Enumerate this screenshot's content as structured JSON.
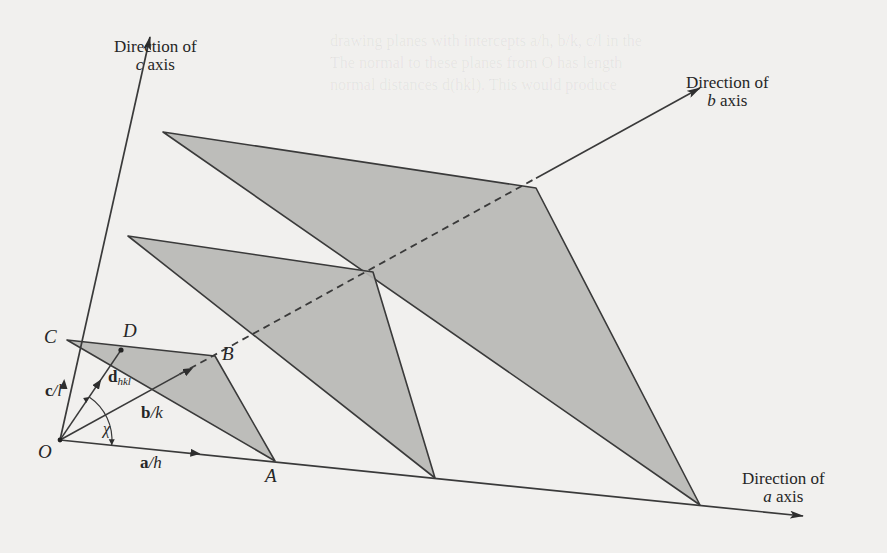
{
  "figure": {
    "colors": {
      "paper": "#f1f0ee",
      "line": "#3a3a3a",
      "plane_fill": "#b9b8b5"
    },
    "axes": {
      "c": {
        "line1": "Direction of",
        "letter": "c",
        "suffix": " axis"
      },
      "b": {
        "line1": "Direction of",
        "letter": "b",
        "suffix": " axis"
      },
      "a": {
        "line1": "Direction of",
        "letter": "a",
        "suffix": " axis"
      }
    },
    "points": {
      "origin": "O",
      "A": "A",
      "B": "B",
      "C": "C",
      "D": "D"
    },
    "vectors": {
      "c_over_l": {
        "bold": "c",
        "rest": "/l"
      },
      "b_over_k": {
        "bold": "b",
        "rest": "/k"
      },
      "a_over_h": {
        "bold": "a",
        "rest": "/h"
      },
      "d_hkl": {
        "bold": "d",
        "sub": "hkl"
      },
      "angle": "χ"
    },
    "geometry": {
      "O": [
        60,
        440
      ],
      "a_end": [
        803,
        516
      ],
      "b_end": [
        700,
        88
      ],
      "c_end": [
        150,
        37
      ],
      "planes": [
        {
          "c": [
            67,
            340
          ],
          "b": [
            215,
            356
          ],
          "a": [
            275,
            461
          ]
        },
        {
          "c": [
            128,
            236
          ],
          "b": [
            373,
            272
          ],
          "a": [
            435,
            478
          ]
        },
        {
          "c": [
            163,
            132
          ],
          "b": [
            536,
            188
          ],
          "a": [
            700,
            505
          ]
        }
      ],
      "D": [
        121,
        350
      ]
    }
  }
}
